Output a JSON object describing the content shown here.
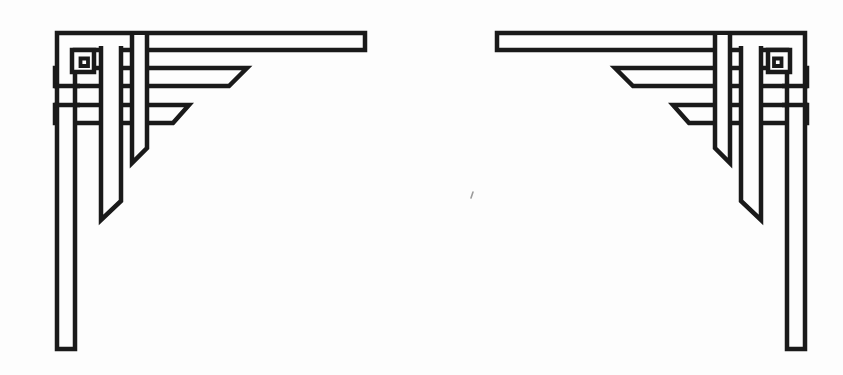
{
  "page": {
    "width": 843,
    "height": 375,
    "background": "#fdfdfd"
  },
  "ornament": {
    "ink": "#1a1a1a",
    "fill": "#fdfdfd",
    "stroke_width": 4.5,
    "mirror_translate_x": 862,
    "left_label": "corner-ornament-left",
    "right_label": "corner-ornament-right",
    "shapes": [
      {
        "name": "ribbon-h3",
        "type": "polygon",
        "points": [
          [
            55,
            105
          ],
          [
            189,
            105
          ],
          [
            173,
            123
          ],
          [
            55,
            123
          ]
        ]
      },
      {
        "name": "ribbon-h2",
        "type": "polygon",
        "points": [
          [
            55,
            68
          ],
          [
            247,
            68
          ],
          [
            229,
            86
          ],
          [
            55,
            86
          ]
        ]
      },
      {
        "name": "corner-l-band",
        "type": "polygon",
        "points": [
          [
            57,
            33
          ],
          [
            365,
            33
          ],
          [
            365,
            50
          ],
          [
            75,
            50
          ],
          [
            75,
            349
          ],
          [
            57,
            349
          ]
        ]
      },
      {
        "name": "h2-bottom-edge-weave",
        "type": "line",
        "points": [
          [
            54,
            86
          ],
          [
            80,
            86
          ]
        ]
      },
      {
        "name": "h3-top-edge-weave",
        "type": "line",
        "points": [
          [
            54,
            105
          ],
          [
            80,
            105
          ]
        ]
      },
      {
        "name": "ribbon-v2",
        "type": "open",
        "points": [
          [
            101,
            46
          ],
          [
            101,
            220
          ],
          [
            121,
            201
          ],
          [
            121,
            46
          ]
        ]
      },
      {
        "name": "ribbon-v3",
        "type": "open",
        "points": [
          [
            132,
            35
          ],
          [
            132,
            163
          ],
          [
            147,
            148
          ],
          [
            147,
            35
          ]
        ]
      },
      {
        "name": "knot-ring-outer",
        "type": "polygon",
        "points": [
          [
            72,
            50
          ],
          [
            94,
            50
          ],
          [
            94,
            72
          ],
          [
            72,
            72
          ]
        ]
      },
      {
        "name": "knot-ring-hole",
        "type": "polygon",
        "stroke_width": 3.8,
        "points": [
          [
            80.5,
            58.5
          ],
          [
            88,
            58.5
          ],
          [
            88,
            66
          ],
          [
            80.5,
            66
          ]
        ]
      }
    ]
  },
  "artifacts": {
    "speck": {
      "x": 473,
      "y": 192,
      "dx": -2,
      "dy": 6,
      "color": "#9b9b9b",
      "width": 1.6
    }
  }
}
